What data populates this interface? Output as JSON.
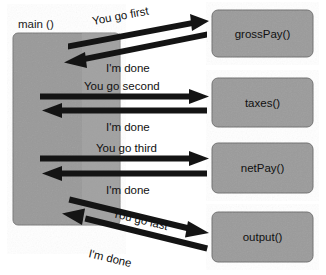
{
  "diagram": {
    "colors": {
      "box_fill": "#999999",
      "box_fill_light": "#a6a6a6",
      "box_stroke": "#6e6e6e",
      "arrow": "#141414",
      "text": "#111111",
      "background": "#ffffff"
    },
    "caller": {
      "label": "main ()",
      "box": {
        "x": 13,
        "y": 33,
        "width": 107,
        "height": 192
      }
    },
    "callees": [
      {
        "id": "grossPay",
        "label": "grossPay()",
        "box": {
          "x": 212,
          "y": 10,
          "width": 101,
          "height": 47
        }
      },
      {
        "id": "taxes",
        "label": "taxes()",
        "box": {
          "x": 212,
          "y": 78,
          "width": 101,
          "height": 49
        }
      },
      {
        "id": "netPay",
        "label": "netPay()",
        "box": {
          "x": 212,
          "y": 143,
          "width": 101,
          "height": 50
        }
      },
      {
        "id": "output",
        "label": "output()",
        "box": {
          "x": 212,
          "y": 212,
          "width": 101,
          "height": 50
        }
      }
    ],
    "exchanges": [
      {
        "target": "grossPay",
        "call": {
          "label": "You go first",
          "from": {
            "x": 68,
            "y": 47
          },
          "to": {
            "x": 207,
            "y": 21
          },
          "label_x": 93,
          "label_y": 22,
          "label_rotate": -10.6
        },
        "return": {
          "label": "I'm done",
          "from": {
            "x": 207,
            "y": 34
          },
          "to": {
            "x": 66,
            "y": 62
          },
          "label_x": 104,
          "label_y": 68,
          "label_rotate": 0
        }
      },
      {
        "target": "taxes",
        "call": {
          "label": "You go second",
          "from": {
            "x": 68,
            "y": 96
          },
          "to": {
            "x": 207,
            "y": 96
          },
          "label_x": 86,
          "label_y": 91,
          "label_rotate": 0
        },
        "return": {
          "label": "I'm done",
          "from": {
            "x": 207,
            "y": 110
          },
          "to": {
            "x": 66,
            "y": 110
          },
          "label_x": 104,
          "label_y": 127,
          "label_rotate": 0
        }
      },
      {
        "target": "netPay",
        "call": {
          "label": "You go third",
          "from": {
            "x": 68,
            "y": 158
          },
          "to": {
            "x": 207,
            "y": 158
          },
          "label_x": 96,
          "label_y": 153,
          "label_rotate": 0
        },
        "return": {
          "label": "I'm done",
          "from": {
            "x": 207,
            "y": 173
          },
          "to": {
            "x": 66,
            "y": 173
          },
          "label_x": 104,
          "label_y": 190,
          "label_rotate": 0
        }
      },
      {
        "target": "output",
        "call": {
          "label": "You go last",
          "from": {
            "x": 70,
            "y": 199
          },
          "to": {
            "x": 208,
            "y": 232
          },
          "label_x": 113,
          "label_y": 214,
          "label_rotate": 13.5
        },
        "return": {
          "label": "I'm done",
          "from": {
            "x": 208,
            "y": 248
          },
          "to": {
            "x": 68,
            "y": 214
          },
          "label_x": 88,
          "label_y": 252,
          "label_rotate": -13.5
        }
      }
    ]
  }
}
